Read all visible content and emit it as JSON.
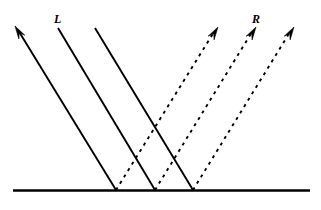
{
  "figure": {
    "width": 321,
    "height": 210,
    "background_color": "#ffffff",
    "stroke_color": "#000000"
  },
  "labels": {
    "incident": "L",
    "reflected": "R"
  },
  "surface": {
    "name": "baseline-surface",
    "x1": 13,
    "y1": 190.5,
    "x2": 310,
    "y2": 190.5,
    "stroke_width": 2.4,
    "style": "solid"
  },
  "incident_rays": {
    "style": "solid",
    "stroke_width": 1.9,
    "direction": "up-left",
    "rays": [
      {
        "name": "incident-ray-1",
        "x1": 116,
        "y1": 190,
        "x2": 18,
        "y2": 30,
        "arrow": true,
        "arrow_at": "end",
        "tip_x": 15,
        "tip_y": 26
      },
      {
        "name": "incident-ray-2",
        "x1": 155,
        "y1": 190,
        "x2": 58,
        "y2": 28,
        "arrow": false,
        "arrow_at": "none",
        "tip_x": 58,
        "tip_y": 28
      },
      {
        "name": "incident-ray-3",
        "x1": 193,
        "y1": 190,
        "x2": 95,
        "y2": 28,
        "arrow": false,
        "arrow_at": "none",
        "tip_x": 95,
        "tip_y": 28
      }
    ]
  },
  "reflected_rays": {
    "style": "dashed",
    "stroke_width": 1.9,
    "dash_pattern": "3 4.5",
    "direction": "up-right",
    "rays": [
      {
        "name": "reflected-ray-1",
        "x1": 116,
        "y1": 190,
        "x2": 214,
        "y2": 32,
        "arrow": true,
        "arrow_at": "end",
        "tip_x": 218,
        "tip_y": 27
      },
      {
        "name": "reflected-ray-2",
        "x1": 155,
        "y1": 190,
        "x2": 252,
        "y2": 32,
        "arrow": true,
        "arrow_at": "end",
        "tip_x": 256,
        "tip_y": 27
      },
      {
        "name": "reflected-ray-3",
        "x1": 193,
        "y1": 190,
        "x2": 290,
        "y2": 32,
        "arrow": true,
        "arrow_at": "end",
        "tip_x": 294,
        "tip_y": 27
      }
    ]
  },
  "contact_points": [
    {
      "name": "contact-point-1",
      "x": 116,
      "y": 190
    },
    {
      "name": "contact-point-2",
      "x": 155,
      "y": 190
    },
    {
      "name": "contact-point-3",
      "x": 193,
      "y": 190
    }
  ]
}
